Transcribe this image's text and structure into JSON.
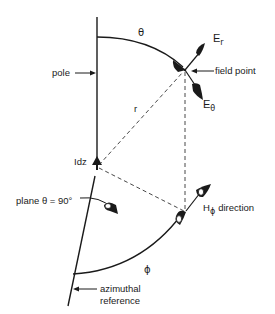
{
  "diagram": {
    "labels": {
      "theta": "θ",
      "E_r_main": "E",
      "E_r_sub": "r",
      "field_point": "field point",
      "E_theta_main": "E",
      "E_theta_sub": "θ",
      "pole": "pole",
      "r": "r",
      "Idz": "Idz",
      "plane": "plane θ = 90°",
      "H_phi_main": "H",
      "H_phi_sub": "ϕ",
      "H_phi_rest": "direction",
      "phi": "ϕ",
      "azimuthal_line1": "azimuthal",
      "azimuthal_line2": "reference"
    },
    "colors": {
      "ink": "#1a1a1a",
      "background": "#ffffff"
    }
  }
}
